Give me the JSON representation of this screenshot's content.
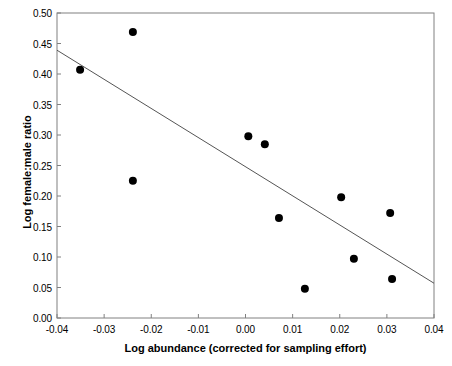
{
  "chart_data": {
    "type": "scatter",
    "title": "",
    "xlabel": "Log abundance (corrected for sampling effort)",
    "ylabel": "Log female:male ratio",
    "xlim": [
      -0.04,
      0.04
    ],
    "ylim": [
      0.0,
      0.5
    ],
    "xticks": [
      -0.04,
      -0.03,
      -0.02,
      -0.01,
      0.0,
      0.01,
      0.02,
      0.03,
      0.04
    ],
    "xtick_labels": [
      "-0.04",
      "-0.03",
      "-0.02",
      "-0.01",
      "0.00",
      "0.01",
      "0.02",
      "0.03",
      "0.04"
    ],
    "yticks": [
      0.0,
      0.05,
      0.1,
      0.15,
      0.2,
      0.25,
      0.3,
      0.35,
      0.4,
      0.45,
      0.5
    ],
    "ytick_labels": [
      "0.00",
      "0.05",
      "0.10",
      "0.15",
      "0.20",
      "0.25",
      "0.30",
      "0.35",
      "0.40",
      "0.45",
      "0.50"
    ],
    "grid": false,
    "legend": null,
    "marker_color": "#000000",
    "marker_size": 5,
    "line_color": "#555555",
    "frame_color": "#808080",
    "points": [
      {
        "x": -0.0351,
        "y": 0.407
      },
      {
        "x": -0.0239,
        "y": 0.469
      },
      {
        "x": -0.0239,
        "y": 0.225
      },
      {
        "x": 0.0006,
        "y": 0.298
      },
      {
        "x": 0.0041,
        "y": 0.285
      },
      {
        "x": 0.0071,
        "y": 0.164
      },
      {
        "x": 0.0126,
        "y": 0.048
      },
      {
        "x": 0.0203,
        "y": 0.198
      },
      {
        "x": 0.023,
        "y": 0.097
      },
      {
        "x": 0.0307,
        "y": 0.172
      },
      {
        "x": 0.0311,
        "y": 0.064
      }
    ],
    "trendline": {
      "x_start": -0.04,
      "y_start": 0.439,
      "x_end": 0.04,
      "y_end": 0.057
    }
  }
}
